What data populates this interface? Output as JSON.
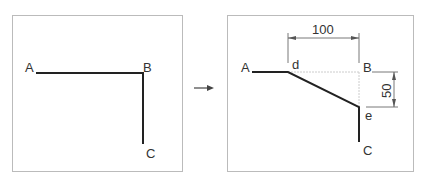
{
  "before": {
    "labels": {
      "a": "A",
      "b": "B",
      "c": "C"
    }
  },
  "arrow": {
    "icon": "right-arrow-icon"
  },
  "after": {
    "labels": {
      "a": "A",
      "b": "B",
      "c": "C",
      "d": "d",
      "e": "e"
    },
    "dimensions": {
      "horizontal": "100",
      "vertical": "50"
    }
  },
  "colors": {
    "line": "#222222",
    "frame": "#bbbbbb",
    "dim": "#555555",
    "dashed": "#cccccc"
  }
}
